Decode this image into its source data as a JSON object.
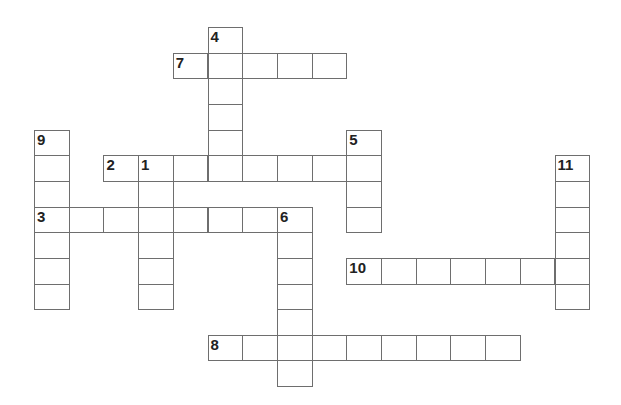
{
  "puzzle": {
    "type": "crossword",
    "cell_width": 34.7,
    "cell_height": 25.65,
    "origin_x": 34,
    "origin_y": 27,
    "border_color": "#6e6e6e",
    "entries": [
      {
        "number": "1",
        "direction": "down",
        "row": 5,
        "col": 3,
        "length": 6
      },
      {
        "number": "2",
        "direction": "across",
        "row": 5,
        "col": 2,
        "length": 8
      },
      {
        "number": "3",
        "direction": "across",
        "row": 7,
        "col": 0,
        "length": 8
      },
      {
        "number": "4",
        "direction": "down",
        "row": 0,
        "col": 5,
        "length": 6
      },
      {
        "number": "5",
        "direction": "down",
        "row": 4,
        "col": 9,
        "length": 4
      },
      {
        "number": "6",
        "direction": "down",
        "row": 7,
        "col": 7,
        "length": 7
      },
      {
        "number": "7",
        "direction": "across",
        "row": 1,
        "col": 4,
        "length": 5
      },
      {
        "number": "8",
        "direction": "across",
        "row": 12,
        "col": 5,
        "length": 9
      },
      {
        "number": "9",
        "direction": "down",
        "row": 4,
        "col": 0,
        "length": 7
      },
      {
        "number": "10",
        "direction": "across",
        "row": 9,
        "col": 9,
        "length": 7
      },
      {
        "number": "11",
        "direction": "down",
        "row": 5,
        "col": 15,
        "length": 6
      }
    ]
  }
}
